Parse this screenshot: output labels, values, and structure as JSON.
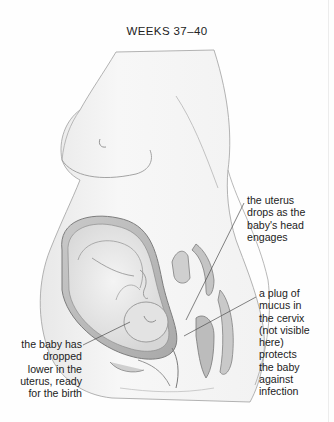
{
  "page": {
    "title": "WEEKS 37–40"
  },
  "illustration": {
    "subject": "cross-section of pregnant woman at weeks 37-40 showing baby in uterus",
    "colors": {
      "skin_fill": "#f5f5f5",
      "outline": "#9a9a9a",
      "uterus_wall": "#b8b8b8",
      "inner_organs": "#a8a8a8",
      "leader_line": "#555555"
    }
  },
  "labels": {
    "uterus_drops": {
      "lines": [
        "the uterus",
        "drops as the",
        "baby's head",
        "engages"
      ]
    },
    "mucus_plug": {
      "lines": [
        "a plug of",
        "mucus in",
        "the cervix",
        "(not visible",
        "here)",
        "protects",
        "the baby",
        "against",
        "infection"
      ]
    },
    "baby_dropped": {
      "lines": [
        "the baby has",
        "dropped",
        "lower in the",
        "uterus, ready",
        "for the birth"
      ]
    }
  }
}
